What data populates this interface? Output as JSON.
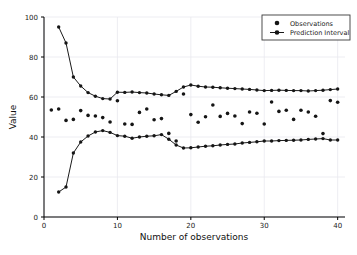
{
  "figure": {
    "background_color": "#ffffff",
    "marker_color": "#151515",
    "line_color": "#1a1a1a",
    "grid_color": "#e9e9ef"
  },
  "axes": {
    "xlabel": "Number of observations",
    "ylabel": "Value",
    "x_ticks": [
      "0",
      "10",
      "20",
      "30",
      "40"
    ],
    "y_ticks": [
      "0",
      "20",
      "40",
      "60",
      "80",
      "100"
    ]
  },
  "legend": {
    "position": "upper-right",
    "entries": [
      {
        "label": "Observations",
        "style": "marker"
      },
      {
        "label": "Prediction Interval",
        "style": "line-marker"
      }
    ]
  },
  "chart_data": {
    "type": "line",
    "title": "",
    "xlabel": "Number of observations",
    "ylabel": "Value",
    "xlim": [
      0,
      41
    ],
    "ylim": [
      0,
      100
    ],
    "xticks": [
      0,
      10,
      20,
      30,
      40
    ],
    "yticks": [
      0,
      20,
      40,
      60,
      80,
      100
    ],
    "grid": true,
    "legend_position": "upper right",
    "series": [
      {
        "name": "Observations",
        "type": "scatter",
        "x": [
          1,
          2,
          3,
          4,
          5,
          6,
          7,
          8,
          9,
          10,
          11,
          12,
          13,
          14,
          15,
          16,
          17,
          18,
          19,
          20,
          21,
          22,
          23,
          24,
          25,
          26,
          27,
          28,
          29,
          30,
          31,
          32,
          33,
          34,
          35,
          36,
          37,
          38,
          39,
          40
        ],
        "y": [
          53.5,
          54.0,
          48.3,
          48.8,
          53.2,
          50.8,
          50.5,
          49.7,
          47.5,
          58.1,
          46.5,
          46.3,
          52.3,
          54.0,
          48.6,
          49.2,
          41.8,
          38.0,
          61.5,
          51.2,
          47.4,
          50.1,
          56.0,
          50.3,
          51.8,
          50.5,
          46.7,
          52.5,
          51.9,
          46.5,
          57.5,
          52.8,
          53.4,
          48.8,
          53.4,
          52.5,
          50.4,
          41.7,
          58.2,
          57.4
        ]
      },
      {
        "name": "Prediction Interval Upper",
        "type": "line",
        "x": [
          2,
          3,
          4,
          5,
          6,
          7,
          8,
          9,
          10,
          11,
          12,
          13,
          14,
          15,
          16,
          17,
          18,
          19,
          20,
          21,
          22,
          23,
          24,
          25,
          26,
          27,
          28,
          29,
          30,
          31,
          32,
          33,
          34,
          35,
          36,
          37,
          38,
          39,
          40
        ],
        "y": [
          95.0,
          87.0,
          70.0,
          65.5,
          62.2,
          60.4,
          59.2,
          59.0,
          62.4,
          62.3,
          62.5,
          62.2,
          62.0,
          61.5,
          61.1,
          60.8,
          62.8,
          65.0,
          66.0,
          65.4,
          65.0,
          64.9,
          64.6,
          64.4,
          64.2,
          64.0,
          63.8,
          63.5,
          63.2,
          63.3,
          63.4,
          63.3,
          63.2,
          63.2,
          63.0,
          63.2,
          63.4,
          63.7,
          64.0
        ]
      },
      {
        "name": "Prediction Interval Lower",
        "type": "line",
        "x": [
          2,
          3,
          4,
          5,
          6,
          7,
          8,
          9,
          10,
          11,
          12,
          13,
          14,
          15,
          16,
          17,
          18,
          19,
          20,
          21,
          22,
          23,
          24,
          25,
          26,
          27,
          28,
          29,
          30,
          31,
          32,
          33,
          34,
          35,
          36,
          37,
          38,
          39,
          40
        ],
        "y": [
          12.5,
          15.0,
          32.0,
          37.5,
          40.5,
          42.5,
          43.2,
          42.3,
          40.7,
          40.4,
          39.4,
          40.0,
          40.4,
          40.6,
          41.2,
          38.9,
          36.0,
          34.5,
          34.6,
          35.0,
          35.4,
          35.6,
          36.0,
          36.3,
          36.5,
          37.0,
          37.3,
          37.6,
          38.0,
          38.0,
          38.2,
          38.3,
          38.4,
          38.5,
          38.8,
          39.0,
          39.2,
          38.5,
          38.5
        ]
      }
    ]
  }
}
